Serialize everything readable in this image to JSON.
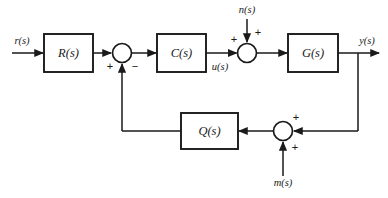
{
  "diagram": {
    "type": "control-system-block-diagram",
    "canvas": {
      "width": 388,
      "height": 198,
      "background": "#ffffff"
    },
    "line_color": "#1a1a1a",
    "blocks": [
      {
        "id": "R",
        "label": "R(s)",
        "x": 44,
        "y": 34,
        "w": 49,
        "h": 38
      },
      {
        "id": "C",
        "label": "C(s)",
        "x": 157,
        "y": 34,
        "w": 49,
        "h": 38
      },
      {
        "id": "G",
        "label": "G(s)",
        "x": 288,
        "y": 34,
        "w": 50,
        "h": 38
      },
      {
        "id": "Q",
        "label": "Q(s)",
        "x": 181,
        "y": 113,
        "w": 57,
        "h": 36
      }
    ],
    "summing_junctions": [
      {
        "id": "sum1",
        "cx": 122,
        "cy": 53,
        "r": 9.5
      },
      {
        "id": "sum2",
        "cx": 247,
        "cy": 53,
        "r": 9.5
      },
      {
        "id": "sum3",
        "cx": 283,
        "cy": 131,
        "r": 9.5
      }
    ],
    "signals": [
      {
        "id": "r",
        "label": "r(s)",
        "x": 22,
        "y": 42
      },
      {
        "id": "u",
        "label": "u(s)",
        "x": 220,
        "y": 68
      },
      {
        "id": "n",
        "label": "n(s)",
        "x": 247,
        "y": 11
      },
      {
        "id": "y",
        "label": "y(s)",
        "x": 367,
        "y": 42
      },
      {
        "id": "m",
        "label": "m(s)",
        "x": 283,
        "y": 184
      }
    ],
    "signs": [
      {
        "id": "sum1-plus",
        "label": "+",
        "x": 110,
        "y": 67
      },
      {
        "id": "sum1-minus",
        "label": "−",
        "x": 135,
        "y": 67
      },
      {
        "id": "sum2-plus-left",
        "label": "+",
        "x": 234,
        "y": 40
      },
      {
        "id": "sum2-plus-top",
        "label": "+",
        "x": 258,
        "y": 33
      },
      {
        "id": "sum3-plus-right",
        "label": "+",
        "x": 296,
        "y": 118
      },
      {
        "id": "sum3-plus-bottom",
        "label": "+",
        "x": 295,
        "y": 148
      }
    ]
  }
}
